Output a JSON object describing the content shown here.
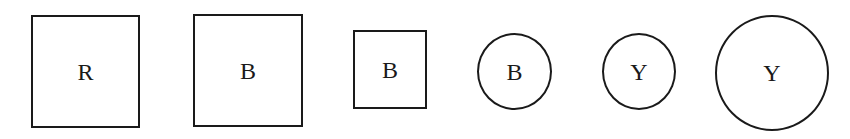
{
  "diagram": {
    "shapes": [
      {
        "type": "square",
        "size": "large",
        "label": "R",
        "x": 31,
        "y": 15,
        "w": 109,
        "h": 113
      },
      {
        "type": "square",
        "size": "large",
        "label": "B",
        "x": 193,
        "y": 14,
        "w": 110,
        "h": 113
      },
      {
        "type": "square",
        "size": "small",
        "label": "B",
        "x": 353,
        "y": 30,
        "w": 74,
        "h": 79
      },
      {
        "type": "circle",
        "size": "small",
        "label": "B",
        "x": 477,
        "y": 33,
        "w": 75,
        "h": 77
      },
      {
        "type": "circle",
        "size": "small",
        "label": "Y",
        "x": 602,
        "y": 33,
        "w": 74,
        "h": 77
      },
      {
        "type": "circle",
        "size": "large",
        "label": "Y",
        "x": 715,
        "y": 15,
        "w": 114,
        "h": 116
      }
    ],
    "stroke_color": "#1a1a1a",
    "background_color": "#ffffff"
  }
}
